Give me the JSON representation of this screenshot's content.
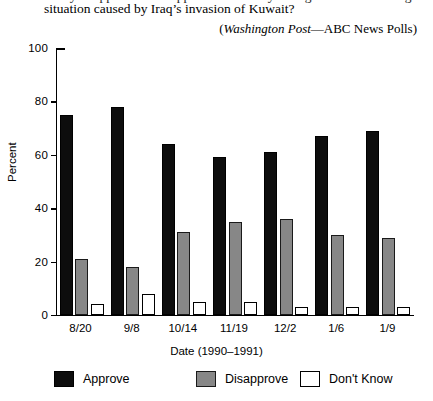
{
  "caption": {
    "line_top": "“Do you approve or disapprove of the way George Bush is handling the",
    "line_main": "situation caused by Iraq’s invasion of Kuwait?",
    "source_italic": "Washington Post",
    "source_rest": "—ABC News Polls)",
    "source_open": "("
  },
  "axes": {
    "y_title": "Percent",
    "x_title": "Date (1990–1991)",
    "y_ticks": [
      0,
      20,
      40,
      60,
      80,
      100
    ],
    "y_min": 0,
    "y_max": 100
  },
  "legend": {
    "items": [
      {
        "label": "Approve",
        "swatch": "approve",
        "color": "#0d0d0d"
      },
      {
        "label": "Disapprove",
        "swatch": "disapprove",
        "color": "#878787"
      },
      {
        "label": "Don't Know",
        "swatch": "dontknow",
        "color": "#ffffff"
      }
    ]
  },
  "chart_data": {
    "type": "bar",
    "subtitle": "(Washington Post—ABC News Polls)",
    "xlabel": "Date (1990–1991)",
    "ylabel": "Percent",
    "ylim": [
      0,
      100
    ],
    "yticks": [
      0,
      20,
      40,
      60,
      80,
      100
    ],
    "grid": false,
    "legend_position": "bottom",
    "categories": [
      "8/20",
      "9/8",
      "10/14",
      "11/19",
      "12/2",
      "1/6",
      "1/9"
    ],
    "series": [
      {
        "name": "Approve",
        "color": "#0d0d0d",
        "values": [
          75,
          78,
          64,
          59,
          61,
          67,
          69
        ]
      },
      {
        "name": "Disapprove",
        "color": "#878787",
        "values": [
          21,
          18,
          31,
          35,
          36,
          30,
          29
        ]
      },
      {
        "name": "Don't Know",
        "color": "#ffffff",
        "values": [
          4,
          8,
          5,
          5,
          3,
          3,
          3
        ]
      }
    ]
  }
}
